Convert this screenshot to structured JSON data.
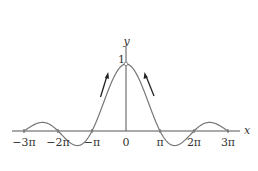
{
  "chart_data": {
    "type": "line",
    "title": "",
    "function": "y = sin(x)/x",
    "xlabel": "x",
    "ylabel": "y",
    "x_ticks": [
      "-3π",
      "-2π",
      "-π",
      "0",
      "π",
      "2π",
      "3π"
    ],
    "x_tick_values": [
      -9.4248,
      -6.2832,
      -3.1416,
      0,
      3.1416,
      6.2832,
      9.4248
    ],
    "y_ticks": [
      "1"
    ],
    "xlim": [
      -9.4248,
      9.4248
    ],
    "ylim": [
      -0.25,
      1.1
    ],
    "grid": false,
    "legend": null,
    "series": [
      {
        "name": "sin(x)/x",
        "x": [
          -9.42,
          -8.0,
          -7.85,
          -7.0,
          -6.28,
          -5.5,
          -4.49,
          -4.0,
          -3.14,
          -2.0,
          -1.0,
          0,
          1.0,
          2.0,
          3.14,
          4.0,
          4.49,
          5.5,
          6.28,
          7.0,
          7.85,
          8.0,
          9.42
        ],
        "values": [
          0,
          0.124,
          0.127,
          0.094,
          0,
          -0.128,
          -0.217,
          -0.189,
          0,
          0.455,
          0.841,
          1,
          0.841,
          0.455,
          0,
          -0.189,
          -0.217,
          -0.128,
          0,
          0.094,
          0.127,
          0.124,
          0
        ]
      }
    ],
    "annotations": [
      {
        "type": "arrow",
        "side": "left",
        "direction": "up along curve toward peak"
      },
      {
        "type": "arrow",
        "side": "right",
        "direction": "up along curve toward peak"
      },
      {
        "type": "open-point",
        "at": [
          0,
          1
        ],
        "note": "value 1 at x=0 (removable point)"
      }
    ]
  },
  "labels": {
    "x_axis": "x",
    "y_axis": "y",
    "y_one": "1",
    "ticks": [
      "−3π",
      "−2π",
      "−π",
      "0",
      "π",
      "2π",
      "3π"
    ]
  }
}
